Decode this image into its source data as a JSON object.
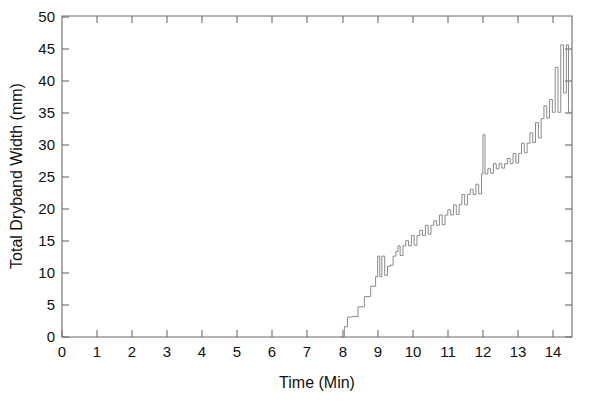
{
  "chart_data": {
    "type": "line",
    "title": "",
    "subtitle": "",
    "xlabel": "Time (Min)",
    "ylabel": "Total Dryband Width (mm)",
    "xlim": [
      0,
      14.54
    ],
    "ylim": [
      0,
      50
    ],
    "xticks": [
      0,
      1,
      2,
      3,
      4,
      5,
      6,
      7,
      8,
      9,
      10,
      11,
      12,
      13,
      14
    ],
    "xticklabels": [
      "0",
      "1",
      "2",
      "3",
      "4",
      "5",
      "6",
      "7",
      "8",
      "9",
      "10",
      "11",
      "12",
      "13",
      "14"
    ],
    "yticks": [
      0,
      5,
      10,
      15,
      20,
      25,
      30,
      35,
      40,
      45,
      50
    ],
    "yticklabels": [
      "0",
      "5",
      "10",
      "15",
      "20",
      "25",
      "30",
      "35",
      "40",
      "45",
      "50"
    ],
    "grid": false,
    "legend": null,
    "legend_position": "none",
    "line_color": "#8a8a8a",
    "axis_color": "#6b6b6b",
    "background_color": "#ffffff",
    "annotations": [],
    "series": [
      {
        "name": "Total Dryband Width",
        "units": "mm",
        "description": "Monotonic staircase growth beginning near t=7.93 min with intermittent spikes; peaks near 45.5 mm at t=14.4 then settles near 35 mm.",
        "x": [
          7.93,
          8.05,
          8.05,
          8.14,
          8.14,
          8.28,
          8.28,
          8.44,
          8.44,
          8.62,
          8.62,
          8.8,
          8.8,
          8.94,
          8.94,
          9.0,
          9.0,
          9.06,
          9.06,
          9.12,
          9.12,
          9.2,
          9.2,
          9.28,
          9.28,
          9.36,
          9.36,
          9.44,
          9.44,
          9.52,
          9.52,
          9.58,
          9.58,
          9.64,
          9.64,
          9.72,
          9.72,
          9.8,
          9.8,
          9.88,
          9.88,
          9.96,
          9.96,
          10.04,
          10.04,
          10.12,
          10.12,
          10.2,
          10.2,
          10.28,
          10.28,
          10.36,
          10.36,
          10.44,
          10.44,
          10.52,
          10.52,
          10.6,
          10.6,
          10.68,
          10.68,
          10.76,
          10.76,
          10.84,
          10.84,
          10.92,
          10.92,
          11.0,
          11.0,
          11.08,
          11.08,
          11.16,
          11.16,
          11.24,
          11.24,
          11.32,
          11.32,
          11.4,
          11.4,
          11.48,
          11.48,
          11.56,
          11.56,
          11.64,
          11.64,
          11.72,
          11.72,
          11.8,
          11.8,
          11.88,
          11.88,
          11.96,
          11.96,
          12.0,
          12.0,
          12.06,
          12.06,
          12.14,
          12.14,
          12.22,
          12.22,
          12.3,
          12.3,
          12.38,
          12.38,
          12.46,
          12.46,
          12.54,
          12.54,
          12.62,
          12.62,
          12.7,
          12.7,
          12.78,
          12.78,
          12.86,
          12.86,
          12.94,
          12.94,
          13.02,
          13.02,
          13.1,
          13.1,
          13.18,
          13.18,
          13.26,
          13.26,
          13.34,
          13.34,
          13.42,
          13.42,
          13.5,
          13.5,
          13.58,
          13.58,
          13.66,
          13.66,
          13.74,
          13.74,
          13.82,
          13.82,
          13.9,
          13.9,
          13.98,
          13.98,
          14.06,
          14.06,
          14.14,
          14.14,
          14.22,
          14.22,
          14.3,
          14.3,
          14.38,
          14.38,
          14.44,
          14.44,
          14.5
        ],
        "y": [
          0.0,
          0.0,
          1.6,
          1.6,
          3.1,
          3.1,
          3.2,
          3.2,
          4.7,
          4.7,
          6.3,
          6.3,
          7.9,
          7.9,
          9.4,
          9.4,
          12.6,
          12.6,
          9.4,
          9.4,
          12.6,
          12.6,
          9.6,
          9.6,
          11.0,
          11.0,
          11.2,
          11.2,
          12.6,
          12.6,
          13.3,
          13.3,
          14.2,
          14.2,
          12.7,
          12.7,
          14.2,
          14.2,
          15.0,
          15.0,
          14.2,
          14.2,
          15.8,
          15.8,
          14.3,
          14.3,
          15.8,
          15.8,
          16.6,
          16.6,
          15.8,
          15.8,
          17.4,
          17.4,
          16.0,
          16.0,
          17.4,
          17.4,
          18.1,
          18.1,
          17.4,
          17.4,
          19.0,
          19.0,
          17.5,
          17.5,
          19.0,
          19.0,
          19.8,
          19.8,
          19.0,
          19.0,
          20.6,
          20.6,
          19.1,
          19.1,
          20.6,
          20.6,
          22.2,
          22.2,
          20.6,
          20.6,
          22.2,
          22.2,
          23.0,
          23.0,
          22.2,
          22.2,
          23.8,
          23.8,
          22.3,
          22.3,
          25.4,
          25.4,
          31.5,
          31.5,
          25.4,
          25.4,
          26.2,
          26.2,
          25.5,
          25.5,
          27.0,
          27.0,
          26.2,
          26.2,
          27.0,
          27.0,
          26.3,
          26.3,
          27.0,
          27.0,
          27.8,
          27.8,
          27.0,
          27.0,
          28.6,
          28.6,
          27.1,
          27.1,
          28.6,
          28.6,
          30.2,
          30.2,
          28.7,
          28.7,
          30.2,
          30.2,
          31.8,
          31.8,
          30.3,
          30.3,
          33.4,
          33.4,
          31.0,
          31.0,
          34.0,
          34.0,
          36.0,
          36.0,
          34.1,
          34.1,
          37.0,
          37.0,
          35.0,
          35.0,
          42.0,
          42.0,
          35.0,
          35.0,
          45.5,
          45.5,
          38.0,
          38.0,
          45.5,
          45.5,
          35.0,
          35.0
        ]
      }
    ]
  },
  "figure": {
    "width": 590,
    "height": 408
  }
}
